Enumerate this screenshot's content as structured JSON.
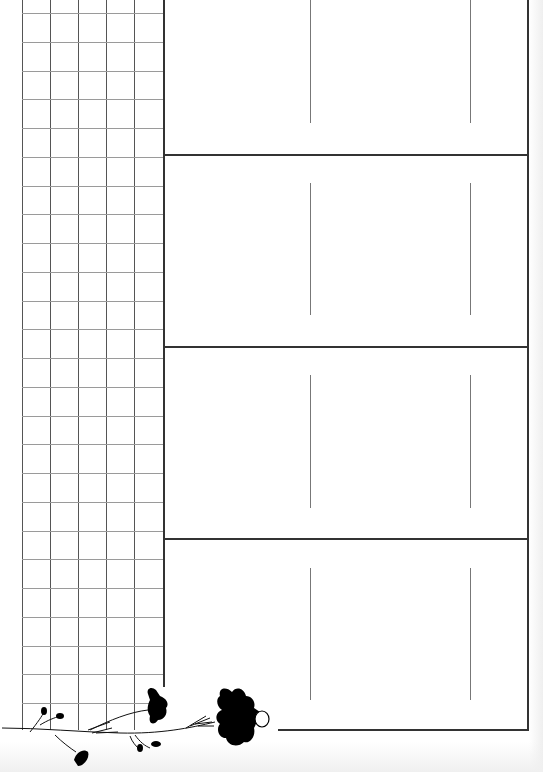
{
  "page": {
    "type": "planner-page",
    "background": "#ffffff",
    "line_color": "#333333",
    "grid_line_color": "#9a9a9a"
  },
  "grid": {
    "columns": 5,
    "rows": 25,
    "column_x": [
      22,
      50,
      78,
      106,
      134,
      162
    ],
    "row_start_y": 13,
    "row_spacing": 28.75
  },
  "sections": [
    {
      "id": "section-1",
      "top": 0,
      "bottom": 154,
      "inner_line_top": 0,
      "inner_line_bottom": 123
    },
    {
      "id": "section-2",
      "top": 154,
      "bottom": 346,
      "inner_line_top": 183,
      "inner_line_bottom": 315
    },
    {
      "id": "section-3",
      "top": 346,
      "bottom": 538,
      "inner_line_top": 375,
      "inner_line_bottom": 508
    },
    {
      "id": "section-4",
      "top": 538,
      "bottom": 730,
      "inner_line_top": 568,
      "inner_line_bottom": 700
    }
  ],
  "inner_line_x": [
    310,
    470
  ],
  "decoration": {
    "icon": "flower-vine-icon",
    "color": "#000000"
  }
}
